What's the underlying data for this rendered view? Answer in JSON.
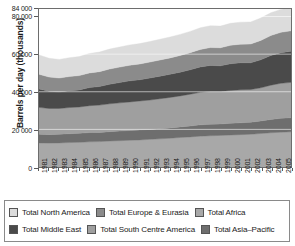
{
  "chart_data": {
    "type": "area",
    "stacked": true,
    "title": "",
    "xlabel": "",
    "ylabel": "Barrels per day (thousands)",
    "grid": false,
    "legend_position": "bottom",
    "xlim": [
      1981,
      2006
    ],
    "ylim": [
      0,
      84000
    ],
    "yticks": [
      0,
      20000,
      40000,
      60000,
      80000,
      84000
    ],
    "ytick_labels": [
      "0",
      "20 000",
      "40 000",
      "60 000",
      "80 000",
      "84 000"
    ],
    "categories": [
      "1981",
      "1982",
      "1983",
      "1984",
      "1985",
      "1986",
      "1987",
      "1988",
      "1989",
      "1990",
      "1991",
      "1992",
      "1993",
      "1994",
      "1995",
      "1996",
      "1997",
      "1998",
      "1999",
      "2000",
      "2001",
      "2002",
      "2003",
      "2004",
      "2005",
      "2006"
    ],
    "series": [
      {
        "name": "Total Asia–Pacific",
        "color": "#a8a8a8",
        "values": [
          12800,
          12700,
          12800,
          13000,
          13100,
          13400,
          13500,
          13800,
          14000,
          14200,
          14400,
          14700,
          15000,
          15300,
          15700,
          16000,
          16400,
          16600,
          16800,
          17000,
          17200,
          17400,
          17800,
          18200,
          18500,
          18700
        ]
      },
      {
        "name": "Total Africa",
        "color": "#6e6e6e",
        "values": [
          4600,
          4500,
          4600,
          4700,
          4800,
          4900,
          4900,
          5000,
          5100,
          5200,
          5300,
          5300,
          5400,
          5500,
          5600,
          5800,
          6000,
          6100,
          6100,
          6200,
          6300,
          6400,
          6700,
          7100,
          7400,
          7500
        ]
      },
      {
        "name": "Total South Centre America",
        "color": "#9f9f9f",
        "values": [
          14300,
          13900,
          13700,
          13900,
          14000,
          14300,
          14500,
          14800,
          15000,
          15200,
          15400,
          15600,
          15900,
          16200,
          16500,
          16900,
          17300,
          17500,
          17300,
          17500,
          17600,
          17400,
          17600,
          18200,
          18600,
          18800
        ]
      },
      {
        "name": "Total Middle East",
        "color": "#4a4a4a",
        "values": [
          9800,
          9200,
          8800,
          9000,
          9100,
          9600,
          9900,
          10400,
          10800,
          11200,
          11300,
          11700,
          12000,
          12300,
          12600,
          13000,
          13500,
          13800,
          13600,
          14200,
          14300,
          14200,
          14900,
          15800,
          16300,
          16500
        ]
      },
      {
        "name": "Total Europe & Eurasia",
        "color": "#8b8b8b",
        "values": [
          7800,
          7500,
          7400,
          7500,
          7600,
          7800,
          7900,
          8100,
          8200,
          8300,
          8400,
          8500,
          8600,
          8700,
          8900,
          9100,
          9300,
          9500,
          9600,
          9800,
          9900,
          10000,
          10300,
          10600,
          10800,
          10900
        ]
      },
      {
        "name": "Total North America",
        "color": "#dcdcdc",
        "values": [
          10300,
          10000,
          9900,
          10000,
          10100,
          10300,
          10400,
          10600,
          10700,
          10800,
          10800,
          10900,
          11000,
          11100,
          11200,
          11300,
          11500,
          11600,
          11500,
          11700,
          11700,
          11700,
          11900,
          12100,
          12200,
          12300
        ]
      }
    ],
    "totals": [
      59600,
      57800,
      57200,
      58100,
      58700,
      60300,
      61100,
      62700,
      63800,
      64900,
      65600,
      66700,
      67900,
      69100,
      70500,
      72100,
      74000,
      75100,
      74900,
      76400,
      77000,
      77100,
      79200,
      82000,
      83800,
      84700
    ]
  },
  "legend": {
    "rows": [
      [
        {
          "label": "Total North America",
          "color": "#dcdcdc"
        },
        {
          "label": "Total Europe & Eurasia",
          "color": "#8b8b8b"
        },
        {
          "label": "Total Africa",
          "color": "#a8a8a8"
        }
      ],
      [
        {
          "label": "Total Middle East",
          "color": "#4a4a4a"
        },
        {
          "label": "Total South Centre America",
          "color": "#9f9f9f"
        },
        {
          "label": "Total Asia–Pacific",
          "color": "#6e6e6e"
        }
      ]
    ]
  }
}
